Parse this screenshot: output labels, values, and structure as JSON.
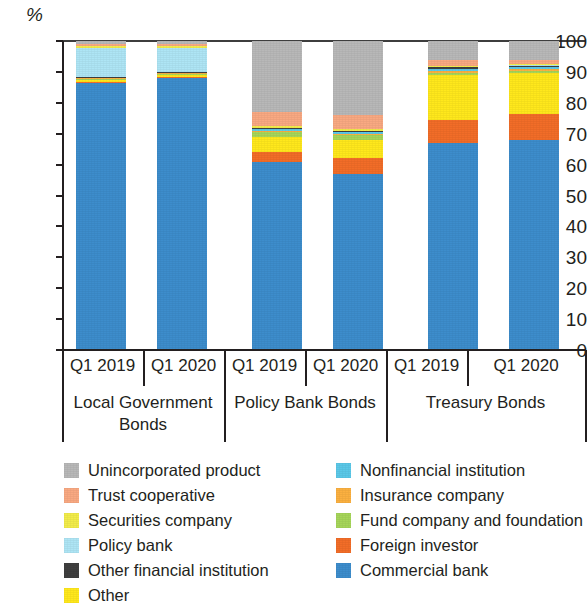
{
  "chart_data": {
    "type": "bar",
    "subtype": "stacked-bar-100-percent",
    "title": "",
    "xlabel": "",
    "ylabel": "%",
    "ylim": [
      0,
      100
    ],
    "yticks": [
      0,
      10,
      20,
      30,
      40,
      50,
      60,
      70,
      80,
      90,
      100
    ],
    "grid": false,
    "legend_position": "bottom",
    "groups": [
      {
        "name": "Local Government Bonds",
        "categories": [
          "Q1 2019",
          "Q1 2020"
        ]
      },
      {
        "name": "Policy Bank Bonds",
        "categories": [
          "Q1 2019",
          "Q1 2020"
        ]
      },
      {
        "name": "Treasury Bonds",
        "categories": [
          "Q1 2019",
          "Q1 2020"
        ]
      }
    ],
    "categories": [
      "Local Government Bonds Q1 2019",
      "Local Government Bonds Q1 2020",
      "Policy Bank Bonds Q1 2019",
      "Policy Bank Bonds Q1 2020",
      "Treasury Bonds Q1 2019",
      "Treasury Bonds Q1 2020"
    ],
    "series": [
      {
        "name": "Commercial bank",
        "color": "#3d8dcc",
        "values": [
          86.5,
          88.0,
          61.0,
          57.0,
          67.0,
          68.0
        ]
      },
      {
        "name": "Foreign investor",
        "color": "#f26d28",
        "values": [
          0.2,
          0.2,
          3.0,
          5.0,
          7.5,
          8.5
        ]
      },
      {
        "name": "Other",
        "color": "#ffe81c",
        "values": [
          0.8,
          0.8,
          5.0,
          6.0,
          14.5,
          13.0
        ]
      },
      {
        "name": "Fund company and foundation",
        "color": "#a6d55a",
        "values": [
          0.3,
          0.3,
          1.5,
          1.5,
          0.8,
          0.8
        ]
      },
      {
        "name": "Insurance company",
        "color": "#fbb040",
        "values": [
          0.2,
          0.2,
          0.5,
          0.5,
          0.5,
          0.5
        ]
      },
      {
        "name": "Nonfinancial institution",
        "color": "#5bc8e8",
        "values": [
          0.2,
          0.2,
          0.5,
          0.5,
          0.7,
          0.7
        ]
      },
      {
        "name": "Other financial institution",
        "color": "#3f3f3f",
        "values": [
          0.2,
          0.2,
          0.3,
          0.3,
          0.5,
          0.5
        ]
      },
      {
        "name": "Policy bank",
        "color": "#aee5f5",
        "values": [
          9.5,
          8.0,
          0.2,
          0.2,
          0.2,
          0.2
        ]
      },
      {
        "name": "Securities company",
        "color": "#f2ec4a",
        "values": [
          0.6,
          0.6,
          0.5,
          0.5,
          0.3,
          0.3
        ]
      },
      {
        "name": "Trust cooperative",
        "color": "#f9a982",
        "values": [
          0.5,
          0.5,
          4.5,
          4.5,
          2.0,
          1.5
        ]
      },
      {
        "name": "Unincorporated product",
        "color": "#b8b8b8",
        "values": [
          1.0,
          1.0,
          23.0,
          24.0,
          6.0,
          6.0
        ]
      }
    ],
    "axis": {
      "unit_label": "%",
      "tick_labels": [
        "100",
        "90",
        "80",
        "70",
        "60",
        "50",
        "40",
        "30",
        "20",
        "10",
        "0"
      ]
    }
  },
  "legend": {
    "left_column": [
      {
        "label": "Unincorporated product",
        "color": "#b8b8b8"
      },
      {
        "label": "Trust cooperative",
        "color": "#f9a982"
      },
      {
        "label": "Securities company",
        "color": "#f2ec4a"
      },
      {
        "label": "Policy bank",
        "color": "#aee5f5"
      },
      {
        "label": "Other financial institution",
        "color": "#3f3f3f"
      },
      {
        "label": "Other",
        "color": "#ffe81c"
      }
    ],
    "right_column": [
      {
        "label": "Nonfinancial institution",
        "color": "#5bc8e8"
      },
      {
        "label": "Insurance company",
        "color": "#fbb040"
      },
      {
        "label": "Fund company and foundation",
        "color": "#a6d55a"
      },
      {
        "label": "Foreign investor",
        "color": "#f26d28"
      },
      {
        "label": "Commercial bank",
        "color": "#3d8dcc"
      }
    ]
  }
}
